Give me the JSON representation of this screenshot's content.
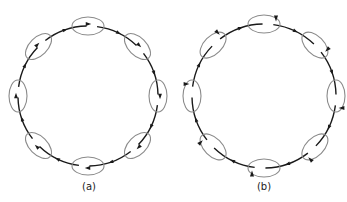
{
  "figure": {
    "panels": [
      {
        "id": "a",
        "label": "(a)",
        "cx": 88,
        "cy": 96,
        "r": 70,
        "label_x": 89,
        "label_y": 181
      },
      {
        "id": "b",
        "label": "(b)",
        "cx": 264,
        "cy": 96,
        "r": 72,
        "label_x": 264,
        "label_y": 181
      }
    ],
    "ring_count": 8,
    "colors": {
      "line": "#1a1a1a",
      "ring": "#8a8a8a"
    }
  }
}
